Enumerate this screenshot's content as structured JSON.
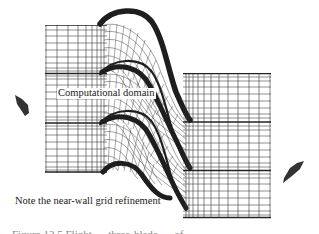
{
  "figure": {
    "type": "turbomachinery blade-passage computational mesh",
    "labels": {
      "computational_domain": "Computational domain",
      "near_wall_note": "Note the near-wall grid refinement"
    },
    "caption_partial": "Figure 12.5  Flight … three-blade … of …",
    "passages": 3,
    "arrows": [
      {
        "name": "inflow-arrow",
        "direction": "up-left",
        "position": "left"
      },
      {
        "name": "outflow-arrow",
        "direction": "down-right",
        "position": "right"
      }
    ],
    "colors": {
      "mesh_line": "#2a2a2a",
      "blade_wall": "#1e1e1e",
      "arrow_fill": "#333333",
      "background": "#ffffff"
    }
  }
}
